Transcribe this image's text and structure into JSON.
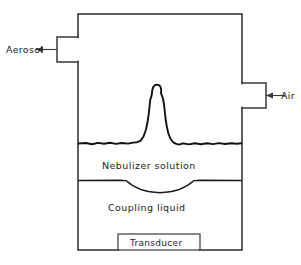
{
  "figure": {
    "type": "schematic-diagram",
    "background_color": "#ffffff",
    "line_color": "#222222"
  },
  "labels": {
    "aerosol": "Aerosol",
    "air": "Air",
    "nebulizer_solution": "Nebulizer solution",
    "coupling_liquid": "Coupling liquid",
    "transducer": "Transducer"
  },
  "ports": [
    {
      "name": "aerosol-outlet",
      "label": "Aerosol",
      "side": "left",
      "arrow_direction": "left",
      "x": 57,
      "y": 37,
      "width": 21,
      "height": 25
    },
    {
      "name": "air-inlet",
      "label": "Air",
      "side": "right",
      "arrow_direction": "left",
      "x": 242,
      "y": 83,
      "width": 24,
      "height": 25
    }
  ],
  "chamber": {
    "x": 78,
    "y": 14,
    "width": 164,
    "height": 236
  },
  "layers": [
    {
      "name": "nebulizer-solution",
      "label": "Nebulizer solution",
      "top_y": 143,
      "bottom_y": 180,
      "label_y": 166
    },
    {
      "name": "coupling-liquid",
      "label": "Coupling liquid",
      "top_y": 180,
      "bottom_y": 250,
      "label_y": 208
    }
  ],
  "features": {
    "fountain_peak_x": 158,
    "fountain_peak_y": 85,
    "surface_level_y": 143,
    "membrane_dip_y": 192
  },
  "transducer_box": {
    "label": "Transducer",
    "x": 118,
    "y": 234,
    "width": 82,
    "height": 16
  }
}
